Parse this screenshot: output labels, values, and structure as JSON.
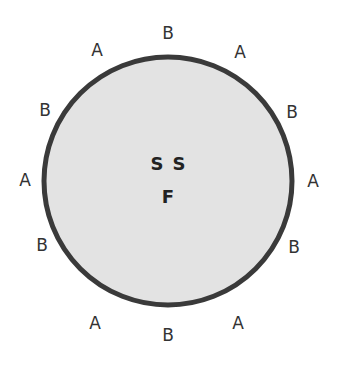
{
  "diagram": {
    "circle": {
      "cx": 168,
      "cy": 181,
      "r": 124,
      "fill": "#e3e3e3",
      "stroke": "#3a3a3a",
      "stroke_width": 5
    },
    "center_labels": [
      {
        "text": "S",
        "x": 157,
        "y": 163
      },
      {
        "text": "S",
        "x": 179,
        "y": 163
      },
      {
        "text": "F",
        "x": 168,
        "y": 196
      }
    ],
    "perimeter_labels": [
      {
        "text": "B",
        "x": 168,
        "y": 33
      },
      {
        "text": "A",
        "x": 240,
        "y": 52
      },
      {
        "text": "B",
        "x": 292,
        "y": 112
      },
      {
        "text": "A",
        "x": 313,
        "y": 181
      },
      {
        "text": "B",
        "x": 294,
        "y": 247
      },
      {
        "text": "A",
        "x": 238,
        "y": 323
      },
      {
        "text": "B",
        "x": 168,
        "y": 335
      },
      {
        "text": "A",
        "x": 95,
        "y": 323
      },
      {
        "text": "B",
        "x": 42,
        "y": 245
      },
      {
        "text": "A",
        "x": 25,
        "y": 180
      },
      {
        "text": "B",
        "x": 45,
        "y": 110
      },
      {
        "text": "A",
        "x": 97,
        "y": 50
      }
    ]
  }
}
